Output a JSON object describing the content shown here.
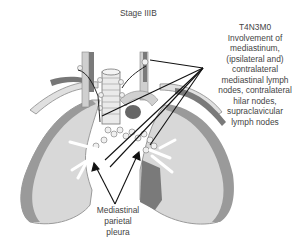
{
  "diagram": {
    "title": "Stage IIIB",
    "annotation": {
      "code": "T4N3M0",
      "lines": [
        "Involvement of",
        "mediastinum,",
        "(ipsilateral and)",
        "contralateral",
        "mediastinal lymph",
        "nodes, contralateral",
        "hilar nodes,",
        "supraclavicular",
        "lymph nodes"
      ]
    },
    "bottom_label": {
      "lines": [
        "Mediastinal",
        "parietal",
        "pleura"
      ]
    },
    "structures": [
      "left-lung",
      "right-lung",
      "trachea",
      "clavicles",
      "mediastinal-lymph-nodes",
      "hilar-nodes",
      "supraclavicular-nodes",
      "mediastinal-pleura"
    ],
    "colors": {
      "lung_fill": "#d6d6d6",
      "lung_edge": "#8f8f8f",
      "pleura_dark": "#7a7a7a",
      "lines": "#111111",
      "text": "#444444"
    }
  }
}
